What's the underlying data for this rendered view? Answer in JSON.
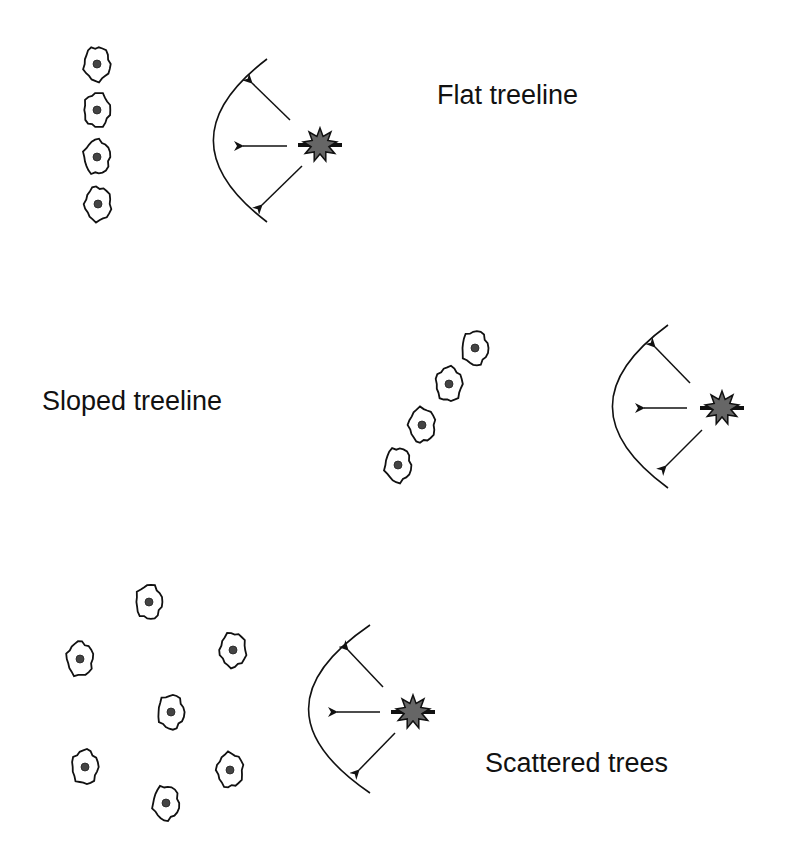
{
  "diagram": {
    "colors": {
      "background": "#ffffff",
      "stroke": "#111111",
      "star_fill": "#666666",
      "tree_core": "#444444"
    },
    "panels": [
      {
        "id": "flat",
        "label": "Flat treeline",
        "label_pos": [
          437,
          82
        ],
        "trees": [
          [
            97,
            64
          ],
          [
            97,
            110
          ],
          [
            97,
            157
          ],
          [
            98,
            204
          ]
        ],
        "arc": {
          "top": [
            267,
            59
          ],
          "left_x": 212,
          "bottom": [
            267,
            222
          ]
        },
        "star": {
          "center": [
            320,
            145
          ],
          "icon": "explosion-icon"
        },
        "arrows": [
          {
            "from": [
              290,
              120
            ],
            "to": [
              252,
              83
            ]
          },
          {
            "from": [
              287,
              146
            ],
            "to": [
              243,
              146
            ]
          },
          {
            "from": [
              302,
              166
            ],
            "to": [
              262,
              205
            ]
          }
        ]
      },
      {
        "id": "sloped",
        "label": "Sloped treeline",
        "label_pos": [
          42,
          388
        ],
        "trees": [
          [
            475,
            348
          ],
          [
            449,
            384
          ],
          [
            422,
            425
          ],
          [
            398,
            465
          ]
        ],
        "arc": {
          "top": [
            668,
            325
          ],
          "left_x": 611,
          "bottom": [
            668,
            488
          ]
        },
        "star": {
          "center": [
            722,
            408
          ],
          "icon": "explosion-icon"
        },
        "arrows": [
          {
            "from": [
              690,
              383
            ],
            "to": [
              655,
              347
            ]
          },
          {
            "from": [
              687,
              408
            ],
            "to": [
              644,
              408
            ]
          },
          {
            "from": [
              702,
              430
            ],
            "to": [
              666,
              466
            ]
          }
        ]
      },
      {
        "id": "scattered",
        "label": "Scattered trees",
        "label_pos": [
          485,
          750
        ],
        "trees": [
          [
            149,
            602
          ],
          [
            80,
            659
          ],
          [
            233,
            650
          ],
          [
            171,
            712
          ],
          [
            85,
            767
          ],
          [
            230,
            770
          ],
          [
            166,
            803
          ]
        ],
        "arc": {
          "top": [
            370,
            625
          ],
          "left_x": 307,
          "bottom": [
            370,
            793
          ]
        },
        "star": {
          "center": [
            413,
            712
          ],
          "icon": "explosion-icon"
        },
        "arrows": [
          {
            "from": [
              383,
              687
            ],
            "to": [
              348,
              650
            ]
          },
          {
            "from": [
              380,
              712
            ],
            "to": [
              337,
              712
            ]
          },
          {
            "from": [
              395,
              733
            ],
            "to": [
              359,
              770
            ]
          }
        ]
      }
    ]
  }
}
